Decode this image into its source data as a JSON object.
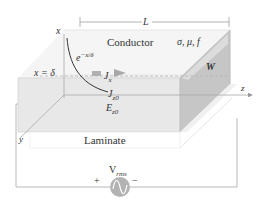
{
  "diagram": {
    "labels": {
      "length": "L",
      "conductor": "Conductor",
      "material_params": "σ, μ, f",
      "width": "W",
      "decay": "e",
      "decay_exp": "−x/δ",
      "skin_depth": "x = δ",
      "current_density": "J",
      "current_density_sub": "x",
      "surface_current": "J",
      "surface_current_sub": "z0",
      "surface_field": "E",
      "surface_field_sub": "z0",
      "laminate": "Laminate",
      "source": "V",
      "source_sub": "rms",
      "plus": "+",
      "minus": "−",
      "axis_x": "x",
      "axis_y": "y",
      "axis_z": "z"
    },
    "colors": {
      "front_face": "#e6e6e6",
      "side_face": "#c4c4c4",
      "top_face": "#f4f4f4",
      "lines": "#9a9a9a",
      "source": "#b0b0b0",
      "arrow": "#a8a8a8",
      "curve": "#333333"
    }
  }
}
